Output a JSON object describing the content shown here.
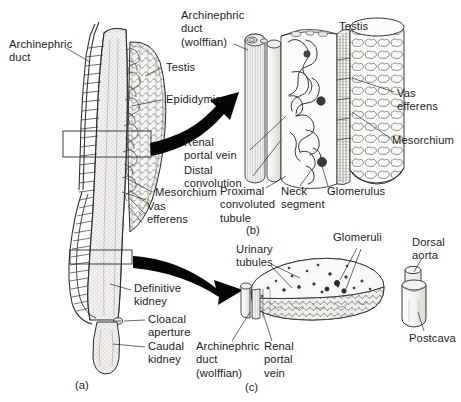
{
  "figure": {
    "panels": [
      {
        "id": "panel-a",
        "caption": "(a)",
        "description": "Ventral view of whole opisthonephric kidney with testis"
      },
      {
        "id": "panel-b",
        "caption": "(b)",
        "description": "Enlarged block of anterior kidney region"
      },
      {
        "id": "panel-c",
        "caption": "(c)",
        "description": "Transverse section through definitive kidney"
      }
    ],
    "ink_color": "#1a1a1a",
    "background_color": "#ffffff",
    "arrow_color": "#000000"
  },
  "panel_a": {
    "caption": "(a)",
    "labels": {
      "archinephric_duct": "Archinephric\nduct",
      "testis": "Testis",
      "epididymis": "Epididymis",
      "mesorchium": "Mesorchium",
      "vas_efferens": "Vas\nefferens",
      "definitive_kidney": "Definitive\nkidney",
      "cloacal_aperture": "Cloacal\naperture",
      "caudal_kidney": "Caudal\nkidney"
    }
  },
  "panel_b": {
    "caption": "(b)",
    "labels": {
      "archinephric_duct_wolffian": "Archinephric\nduct\n(wolffian)",
      "testis": "Testis",
      "vas_efferens": "Vas\nefferens",
      "mesorchium": "Mesorchium",
      "renal_portal_vein": "Renal\nportal vein",
      "distal_convolution": "Distal\nconvolution",
      "proximal_convoluted_tubule": "Proximal\nconvoluted\ntubule",
      "neck_segment": "Neck\nsegment",
      "glomerulus": "Glomerulus"
    }
  },
  "panel_c": {
    "caption": "(c)",
    "labels": {
      "urinary_tubules": "Urinary\ntubules",
      "glomeruli": "Glomeruli",
      "dorsal_aorta": "Dorsal\naorta",
      "postcava": "Postcava",
      "archinephric_duct_wolffian": "Archinephric\nduct\n(wolffian)",
      "renal_portal_vein": "Renal\nportal\nvein"
    }
  }
}
